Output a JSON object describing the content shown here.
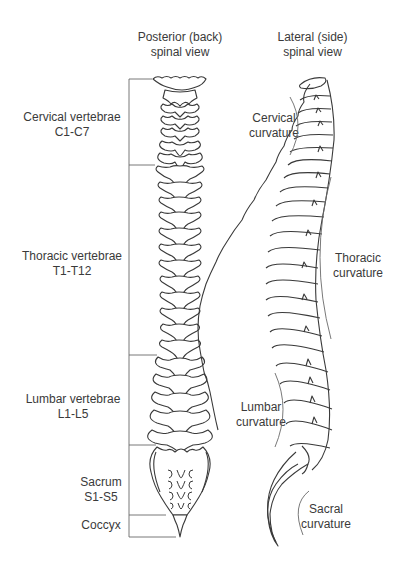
{
  "titles": {
    "posterior": {
      "line1": "Posterior (back)",
      "line2": "spinal view"
    },
    "lateral": {
      "line1": "Lateral (side)",
      "line2": "spinal view"
    }
  },
  "posterior_labels": [
    {
      "name": "Cervical vertebrae",
      "range": "C1-C7"
    },
    {
      "name": "Thoracic vertebrae",
      "range": "T1-T12"
    },
    {
      "name": "Lumbar vertebrae",
      "range": "L1-L5"
    },
    {
      "name": "Sacrum",
      "range": "S1-S5"
    },
    {
      "name": "Coccyx",
      "range": ""
    }
  ],
  "lateral_labels": [
    {
      "line1": "Cervical",
      "line2": "curvature"
    },
    {
      "line1": "Thoracic",
      "line2": "curvature"
    },
    {
      "line1": "Lumbar",
      "line2": "curvature"
    },
    {
      "line1": "Sacral",
      "line2": "curvature"
    }
  ],
  "colors": {
    "line": "#3a3a3a",
    "bracket": "#6a6a6a",
    "background": "#ffffff"
  }
}
